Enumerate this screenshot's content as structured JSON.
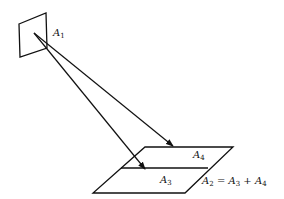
{
  "diagram": {
    "type": "geometric-projection",
    "stroke_color": "#111111",
    "background": "#ffffff",
    "source_patch": {
      "label_base": "A",
      "label_sub": "1",
      "points": [
        [
          19,
          24
        ],
        [
          46,
          13
        ],
        [
          47,
          48
        ],
        [
          20,
          57
        ]
      ]
    },
    "arrows": [
      {
        "from": [
          34,
          33
        ],
        "to": [
          173,
          146
        ],
        "target": "A4"
      },
      {
        "from": [
          34,
          33
        ],
        "to": [
          145,
          169
        ],
        "target": "A3"
      }
    ],
    "target_surface": {
      "outer": [
        [
          145,
          147
        ],
        [
          233,
          147
        ],
        [
          185,
          193
        ],
        [
          93,
          193
        ]
      ],
      "divider": [
        [
          121,
          168
        ],
        [
          208,
          168
        ]
      ]
    },
    "labels": {
      "a4": {
        "base": "A",
        "sub": "4"
      },
      "a3": {
        "base": "A",
        "sub": "3"
      }
    },
    "equation": {
      "lhs": {
        "base": "A",
        "sub": "2"
      },
      "eq": "=",
      "t1": {
        "base": "A",
        "sub": "3"
      },
      "plus": "+",
      "t2": {
        "base": "A",
        "sub": "4"
      }
    }
  }
}
